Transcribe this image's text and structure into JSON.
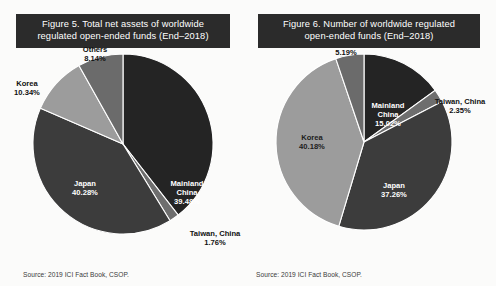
{
  "figures": [
    {
      "id": "figure-5",
      "title_line1": "Figure 5.  Total net assets of worldwide",
      "title_line2": "regulated open-ended funds (End–2018)",
      "source": "Source: 2019 ICI Fact Book, CSOP.",
      "chart_data": {
        "type": "pie",
        "title": "Figure 5.  Total net assets of worldwide regulated open-ended funds (End–2018)",
        "unit": "percent",
        "start_angle_deg": 0,
        "direction": "clockwise",
        "legend": "none",
        "labels_inside": true,
        "categories": [
          "Mainland China",
          "Taiwan, China",
          "Japan",
          "Korea",
          "Others"
        ],
        "values": [
          39.48,
          1.76,
          40.28,
          10.34,
          8.14
        ],
        "colors": [
          "#242424",
          "#6e6e6e",
          "#3c3c3c",
          "#9c9c9c",
          "#6b6b6b"
        ],
        "slices": [
          {
            "name": "Mainland China",
            "value": 39.48,
            "label": "39.48%",
            "color": "#242424",
            "label_pos": "inside",
            "label_color": "#ffffff",
            "lx": 64,
            "ly": 42
          },
          {
            "name": "Taiwan, China",
            "value": 1.76,
            "label": "1.76%",
            "color": "#6e6e6e",
            "label_pos": "outside",
            "label_color": "#111111",
            "lx": 92,
            "ly": 92
          },
          {
            "name": "Japan",
            "value": 40.28,
            "label": "40.28%",
            "color": "#3c3c3c",
            "label_pos": "inside",
            "label_color": "#ffffff",
            "lx": -38,
            "ly": 42
          },
          {
            "name": "Korea",
            "value": 10.34,
            "label": "10.34%",
            "color": "#9c9c9c",
            "label_pos": "outside",
            "label_color": "#111111",
            "lx": -96,
            "ly": -58
          },
          {
            "name": "Others",
            "value": 8.14,
            "label": "8.14%",
            "color": "#6b6b6b",
            "label_pos": "outside",
            "label_color": "#111111",
            "lx": -28,
            "ly": -92
          }
        ]
      }
    },
    {
      "id": "figure-6",
      "title_line1": "Figure 6.  Number of worldwide regulated",
      "title_line2": "open-ended funds (End–2018)",
      "source": "Source: 2019 ICI Fact Book, CSOP.",
      "chart_data": {
        "type": "pie",
        "title": "Figure 6.  Number of worldwide regulated open-ended funds (End–2018)",
        "unit": "percent",
        "start_angle_deg": 0,
        "direction": "clockwise",
        "legend": "none",
        "labels_inside": true,
        "categories": [
          "Mainland China",
          "Taiwan, China",
          "Japan",
          "Korea",
          "Others"
        ],
        "values": [
          15.02,
          2.35,
          37.26,
          40.18,
          5.19
        ],
        "colors": [
          "#242424",
          "#6e6e6e",
          "#3c3c3c",
          "#9c9c9c",
          "#6b6b6b"
        ],
        "slices": [
          {
            "name": "Mainland China",
            "value": 15.02,
            "label": "15.02%",
            "color": "#242424",
            "label_pos": "inside",
            "label_color": "#ffffff",
            "lx": 24,
            "ly": -34
          },
          {
            "name": "Taiwan, China",
            "value": 2.35,
            "label": "2.35%",
            "color": "#6e6e6e",
            "label_pos": "outside",
            "label_color": "#111111",
            "lx": 96,
            "ly": -38
          },
          {
            "name": "Japan",
            "value": 37.26,
            "label": "37.26%",
            "color": "#3c3c3c",
            "label_pos": "inside",
            "label_color": "#ffffff",
            "lx": 30,
            "ly": 46
          },
          {
            "name": "Korea",
            "value": 40.18,
            "label": "40.18%",
            "color": "#9c9c9c",
            "label_pos": "inside",
            "label_color": "#1c1c1c",
            "lx": -52,
            "ly": -2
          },
          {
            "name": "Others",
            "value": 5.19,
            "label": "5.19%",
            "color": "#6b6b6b",
            "label_pos": "outside",
            "label_color": "#111111",
            "lx": -18,
            "ly": -96
          }
        ]
      }
    }
  ]
}
